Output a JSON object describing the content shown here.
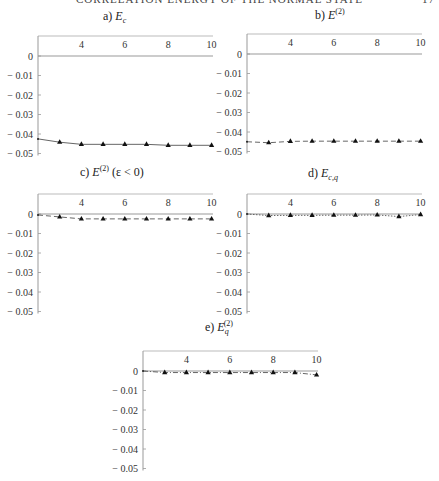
{
  "page": {
    "running_header": "CORRELATION ENERGY OF THE NORMAL STATE",
    "page_number": "17"
  },
  "panels": [
    {
      "id": "a",
      "label": "a)",
      "symbol": "E",
      "sub": "c",
      "sup": "",
      "suffix": ""
    },
    {
      "id": "b",
      "label": "b)",
      "symbol": "E",
      "sub": "",
      "sup": "(2)",
      "suffix": ""
    },
    {
      "id": "c",
      "label": "c)",
      "symbol": "E",
      "sub": "",
      "sup": "(2)",
      "suffix": "(ε < 0)"
    },
    {
      "id": "d",
      "label": "d)",
      "symbol": "E",
      "sub": "c,q",
      "sup": "",
      "suffix": ""
    },
    {
      "id": "e",
      "label": "e)",
      "symbol": "E",
      "sub": "q",
      "sup": "(2)",
      "suffix": ""
    }
  ],
  "chart_data": [
    {
      "type": "line",
      "title": "a) E_c",
      "xlabel": "",
      "ylabel": "",
      "xlim": [
        2,
        10.3
      ],
      "ylim": [
        -0.05,
        0.01
      ],
      "xticks": [
        "4",
        "6",
        "8",
        "10"
      ],
      "yticks": [
        "0",
        "-0.01",
        "-0.02",
        "-0.03",
        "-0.04",
        "-0.05"
      ],
      "line_style": "solid",
      "marker": "triangle",
      "x": [
        2,
        3,
        4,
        5,
        6,
        7,
        8,
        9,
        10
      ],
      "series": [
        {
          "name": "E_c",
          "values": [
            -0.0425,
            -0.0442,
            -0.0453,
            -0.0453,
            -0.0453,
            -0.0453,
            -0.0458,
            -0.0458,
            -0.0458
          ]
        }
      ]
    },
    {
      "type": "line",
      "title": "b) E^(2)",
      "xlabel": "",
      "ylabel": "",
      "xlim": [
        2,
        10.3
      ],
      "ylim": [
        -0.05,
        0.01
      ],
      "xticks": [
        "4",
        "6",
        "8",
        "10"
      ],
      "yticks": [
        "0",
        "-0.01",
        "-0.02",
        "-0.03",
        "-0.04",
        "-0.05"
      ],
      "line_style": "dashed",
      "marker": "triangle",
      "x": [
        2,
        3,
        4,
        5,
        6,
        7,
        8,
        9,
        10
      ],
      "series": [
        {
          "name": "E^(2)",
          "values": [
            -0.045,
            -0.0455,
            -0.0448,
            -0.0447,
            -0.0447,
            -0.0447,
            -0.0447,
            -0.0447,
            -0.0447
          ]
        }
      ]
    },
    {
      "type": "line",
      "title": "c) E^(2) (ε < 0)",
      "xlabel": "",
      "ylabel": "",
      "xlim": [
        2,
        10.3
      ],
      "ylim": [
        -0.05,
        0.01
      ],
      "xticks": [
        "4",
        "6",
        "8",
        "10"
      ],
      "yticks": [
        "0",
        "-0.01",
        "-0.02",
        "-0.03",
        "-0.04",
        "-0.05"
      ],
      "line_style": "dashed",
      "marker": "triangle",
      "x": [
        2,
        3,
        4,
        5,
        6,
        7,
        8,
        9,
        10
      ],
      "series": [
        {
          "name": "E^(2) (ε<0)",
          "values": [
            -0.0005,
            -0.0015,
            -0.0025,
            -0.0025,
            -0.0025,
            -0.0025,
            -0.0025,
            -0.0025,
            -0.0025
          ]
        }
      ]
    },
    {
      "type": "line",
      "title": "d) E_c,q",
      "xlabel": "",
      "ylabel": "",
      "xlim": [
        2,
        10.3
      ],
      "ylim": [
        -0.05,
        0.01
      ],
      "xticks": [
        "4",
        "6",
        "8",
        "10"
      ],
      "yticks": [
        "0",
        "-0.01",
        "-0.02",
        "-0.03",
        "-0.04",
        "-0.05"
      ],
      "line_style": "dotted",
      "marker": "triangle",
      "x": [
        2,
        3,
        4,
        5,
        6,
        7,
        8,
        9,
        10
      ],
      "series": [
        {
          "name": "E_c,q",
          "values": [
            0.0,
            -0.0008,
            -0.0007,
            -0.0007,
            -0.0006,
            -0.0006,
            -0.0005,
            -0.0013,
            -0.0003
          ]
        }
      ]
    },
    {
      "type": "line",
      "title": "e) E_q^(2)",
      "xlabel": "",
      "ylabel": "",
      "xlim": [
        2,
        10.3
      ],
      "ylim": [
        -0.05,
        0.01
      ],
      "xticks": [
        "4",
        "6",
        "8",
        "10"
      ],
      "yticks": [
        "0",
        "-0.01",
        "-0.02",
        "-0.03",
        "-0.04",
        "-0.05"
      ],
      "line_style": "dash-dot",
      "marker": "triangle",
      "x": [
        2,
        3,
        4,
        5,
        6,
        7,
        8,
        9,
        10
      ],
      "series": [
        {
          "name": "E_q^(2)",
          "values": [
            0.0,
            -0.0008,
            -0.0008,
            -0.0008,
            -0.0008,
            -0.0008,
            -0.0008,
            -0.0008,
            -0.002
          ]
        }
      ]
    }
  ]
}
